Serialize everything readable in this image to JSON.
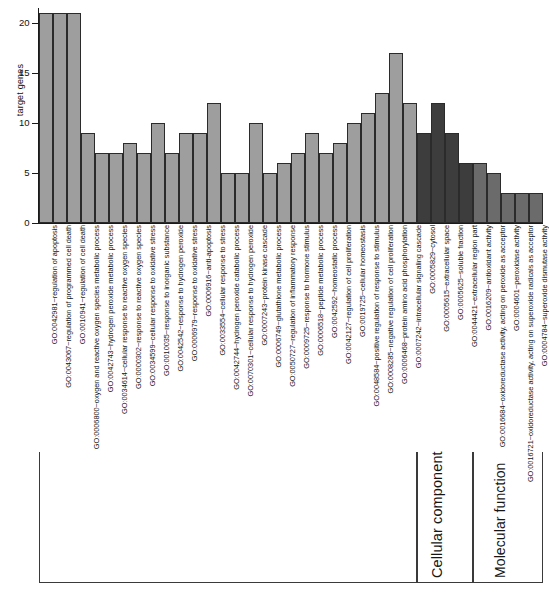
{
  "chart_data": {
    "type": "bar",
    "title": "",
    "xlabel": "",
    "ylabel": "target genes",
    "ylim": [
      0,
      21.5
    ],
    "yticks": [
      0,
      5,
      10,
      15,
      20
    ],
    "ytick_labels": [
      "0",
      "5",
      "10",
      "15",
      "20"
    ],
    "grid": false,
    "legend": "none",
    "categories": [
      "GO:0042981~regulation of apoptosis",
      "GO:0043067~regulation of programmed cell death",
      "GO:0010941~regulation of cell death",
      "GO:0006800~oxygen and reactive oxygen species metabolic process",
      "GO:0042743~hydrogen peroxide metabolic process",
      "GO:0034614~cellular response to reactive oxygen species",
      "GO:0000302~response to reactive oxygen species",
      "GO:0034599~cellular response to oxidative stress",
      "GO:0010035~response to inorganic substance",
      "GO:0042542~response to hydrogen peroxide",
      "GO:0006979~response to oxidative stress",
      "GO:0006916~anti-apoptosis",
      "GO:0033554~cellular response to stress",
      "GO:0042744~hydrogen peroxide catabolic process",
      "GO:0070301~cellular response to hydrogen peroxide",
      "GO:0007243~protein kinase cascade",
      "GO:0006749~glutathione metabolic process",
      "GO:0050727~regulation of inflammatory response",
      "GO:0009725~response to hormone stimulus",
      "GO:0006518~peptide metabolic process",
      "GO:0042592~homeostatic process",
      "GO:0042127~regulation of cell proliferation",
      "GO:0019725~cellular homeostasis",
      "GO:0048584~positive regulation of response to stimulus",
      "GO:0008285~negative regulation of cell proliferation",
      "GO:0006468~protein amino acid phosphorylation",
      "GO:0007242~intracellular signaling cascade",
      "GO:0005829~cytosol",
      "GO:0005615~extracellular space",
      "GO:0005625~soluble fraction",
      "GO:0044421~extracellular region part",
      "GO:0016209~antioxidant activity",
      "GO:0016684~oxidoreductase activity, acting on peroxide as acceptor",
      "GO:0004601~peroxidase activity",
      "GO:0016721~oxidoreductase activity, acting on superoxide radicals as acceptor",
      "GO:0004784~superoxide dismutase activity"
    ],
    "values": [
      21,
      21,
      21,
      9,
      7,
      7,
      8,
      7,
      10,
      7,
      9,
      9,
      12,
      5,
      5,
      10,
      5,
      6,
      7,
      9,
      7,
      8,
      10,
      11,
      13,
      17,
      12,
      9,
      12,
      9,
      6,
      6,
      5,
      3,
      3,
      3
    ],
    "bar_colors": [
      "#9e9e9e",
      "#9e9e9e",
      "#9e9e9e",
      "#9e9e9e",
      "#9e9e9e",
      "#9e9e9e",
      "#9e9e9e",
      "#9e9e9e",
      "#9e9e9e",
      "#9e9e9e",
      "#9e9e9e",
      "#9e9e9e",
      "#9e9e9e",
      "#9e9e9e",
      "#9e9e9e",
      "#9e9e9e",
      "#9e9e9e",
      "#9e9e9e",
      "#9e9e9e",
      "#9e9e9e",
      "#9e9e9e",
      "#9e9e9e",
      "#9e9e9e",
      "#9e9e9e",
      "#9e9e9e",
      "#9e9e9e",
      "#9e9e9e",
      "#3d3d3d",
      "#3d3d3d",
      "#3d3d3d",
      "#3d3d3d",
      "#6b6b6b",
      "#6b6b6b",
      "#6b6b6b",
      "#6b6b6b",
      "#6b6b6b"
    ]
  },
  "groups": [
    {
      "name": "Biological process",
      "start": 0,
      "end": 26,
      "visible_name": false
    },
    {
      "name": "Cellular component",
      "start": 27,
      "end": 30,
      "visible_name": true
    },
    {
      "name": "Molecular function",
      "start": 31,
      "end": 35,
      "visible_name": true
    }
  ],
  "group_labels": {
    "cellular_component": "Cellular component",
    "molecular_function": "Molecular function"
  },
  "colors": {
    "biological_process": "#9e9e9e",
    "cellular_component": "#3d3d3d",
    "molecular_function": "#6b6b6b",
    "axis": "#1a1a1a",
    "bar_edge": "#2b2b2b"
  },
  "caption": ""
}
